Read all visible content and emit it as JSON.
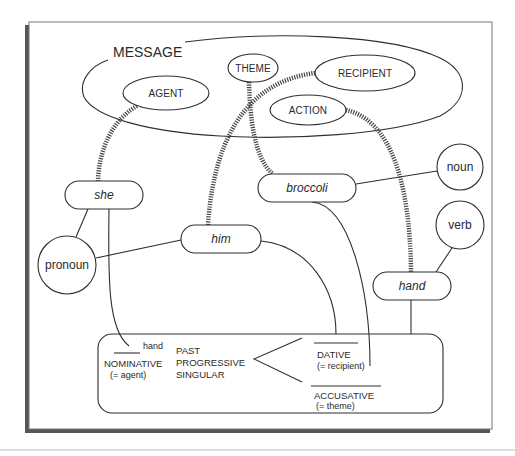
{
  "diagram": {
    "title": "MESSAGE",
    "message_roles": [
      {
        "id": "agent",
        "label": "AGENT"
      },
      {
        "id": "theme",
        "label": "THEME"
      },
      {
        "id": "recipient",
        "label": "RECIPIENT"
      },
      {
        "id": "action",
        "label": "ACTION"
      }
    ],
    "lemmas": [
      {
        "id": "she",
        "label": "she"
      },
      {
        "id": "broccoli",
        "label": "broccoli"
      },
      {
        "id": "him",
        "label": "him"
      },
      {
        "id": "hand",
        "label": "hand"
      }
    ],
    "categories": [
      {
        "id": "noun",
        "label": "noun"
      },
      {
        "id": "verb",
        "label": "verb"
      },
      {
        "id": "pronoun",
        "label": "pronoun"
      }
    ],
    "frame": {
      "verb_slot": "hand",
      "nominative": {
        "label": "NOMINATIVE",
        "gloss": "(= agent)"
      },
      "features": [
        "PAST",
        "PROGRESSIVE",
        "SINGULAR"
      ],
      "dative": {
        "label": "DATIVE",
        "gloss": "(= recipient)"
      },
      "accusative": {
        "label": "ACCUSATIVE",
        "gloss": "(= theme)"
      }
    },
    "links": [
      {
        "from": "AGENT",
        "to": "she",
        "style": "dashed-thick"
      },
      {
        "from": "THEME",
        "to": "broccoli",
        "style": "dashed-thick"
      },
      {
        "from": "RECIPIENT",
        "to": "him",
        "style": "dashed-thick"
      },
      {
        "from": "ACTION",
        "to": "hand",
        "style": "dashed-thick"
      },
      {
        "from": "she",
        "to": "pronoun",
        "style": "solid"
      },
      {
        "from": "him",
        "to": "pronoun",
        "style": "solid"
      },
      {
        "from": "broccoli",
        "to": "noun",
        "style": "solid"
      },
      {
        "from": "hand",
        "to": "verb",
        "style": "solid"
      },
      {
        "from": "she",
        "to": "NOMINATIVE",
        "style": "solid"
      },
      {
        "from": "him",
        "to": "DATIVE",
        "style": "solid"
      },
      {
        "from": "broccoli",
        "to": "ACCUSATIVE",
        "style": "solid"
      },
      {
        "from": "hand",
        "to": "frame",
        "style": "solid"
      }
    ],
    "colors": {
      "ink": "#2f2f2f",
      "frame_shadow": "#555555",
      "page_rule": "#bbbbbb"
    }
  }
}
